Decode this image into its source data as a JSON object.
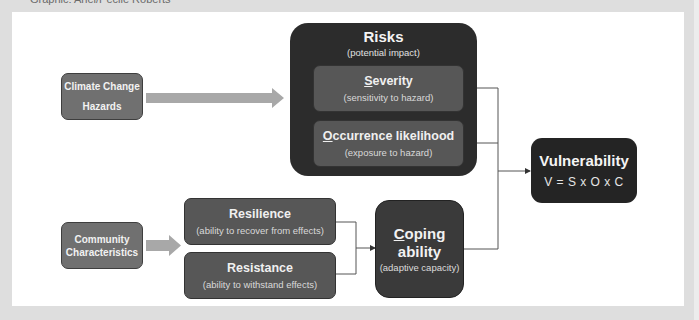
{
  "credit": "Graphic: Ariel/Pécile Roberts",
  "colors": {
    "background": "#dedede",
    "panel": "#ffffff",
    "source_box": "#707070",
    "mid_box": "#575757",
    "risks_box": "#2c2c2c",
    "coping_box": "#3a3a3a",
    "vulnerability_box": "#242424",
    "arrow": "#a8a8a8",
    "connector": "#555555"
  },
  "inputs": {
    "climate": {
      "line1": "Climate Change",
      "line2": "Hazards"
    },
    "community": {
      "line1": "Community",
      "line2": "Characteristics"
    }
  },
  "risks": {
    "title": "Risks",
    "subtitle": "(potential impact)",
    "severity": {
      "initial": "S",
      "rest": "everity",
      "subtitle": "(sensitivity to hazard)"
    },
    "occurrence": {
      "initial": "O",
      "rest": "ccurrence likelihood",
      "subtitle": "(exposure to hazard)"
    }
  },
  "coping_factors": {
    "resilience": {
      "title": "Resilience",
      "subtitle": "(ability to recover from effects)"
    },
    "resistance": {
      "title": "Resistance",
      "subtitle": "(ability to withstand effects)"
    }
  },
  "coping": {
    "initial": "C",
    "rest": "oping",
    "line2": "ability",
    "subtitle": "(adaptive capacity)"
  },
  "vulnerability": {
    "title": "Vulnerability",
    "formula": "V = S x O x C"
  }
}
